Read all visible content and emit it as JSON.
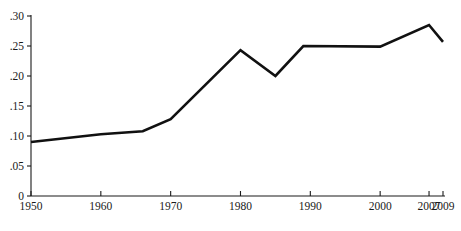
{
  "chart_data": {
    "type": "line",
    "title": "",
    "subtitle": "",
    "xlabel": "",
    "ylabel": "",
    "xlim": [
      1950,
      2009
    ],
    "ylim": [
      0,
      0.3
    ],
    "grid": false,
    "legend": null,
    "x_tick_labels": [
      "1950",
      "1960",
      "1970",
      "1980",
      "1990",
      "2000",
      "2007",
      "2009"
    ],
    "x_tick_values": [
      1950,
      1960,
      1970,
      1980,
      1990,
      2000,
      2007,
      2009
    ],
    "y_tick_labels": [
      "0",
      ".05",
      ".10",
      ".15",
      ".20",
      ".25",
      ".30"
    ],
    "y_tick_values": [
      0,
      0.05,
      0.1,
      0.15,
      0.2,
      0.25,
      0.3
    ],
    "series": [
      {
        "name": "series-1",
        "color": "#111111",
        "x": [
          1950,
          1960,
          1966,
          1970,
          1980,
          1985,
          1989,
          2000,
          2007,
          2009
        ],
        "values": [
          0.09,
          0.103,
          0.108,
          0.128,
          0.243,
          0.2,
          0.25,
          0.249,
          0.285,
          0.257
        ]
      }
    ],
    "annotations": []
  },
  "axes": {
    "y_axis_name": "y-axis",
    "x_axis_name": "x-axis"
  }
}
